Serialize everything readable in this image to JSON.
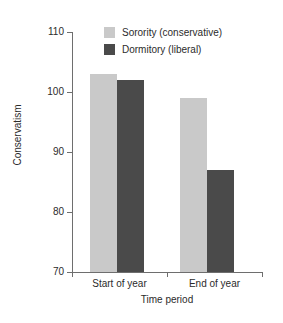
{
  "chart_data": {
    "type": "bar",
    "title": "",
    "subtitle": "",
    "xlabel": "Time period",
    "ylabel": "Conservatism",
    "categories": [
      "Start of year",
      "End of year"
    ],
    "series": [
      {
        "name": "Sorority (conservative)",
        "color": "#c9c9c9",
        "values": [
          103,
          99
        ]
      },
      {
        "name": "Dormitory (liberal)",
        "color": "#4a4a4a",
        "values": [
          102,
          87
        ]
      }
    ],
    "ylim": [
      70,
      110
    ],
    "ytick_labels": [
      "110",
      "100",
      "90",
      "80",
      "70"
    ],
    "ytick_values": [
      110,
      100,
      90,
      80,
      70
    ],
    "grid": false,
    "legend_position": "top-center",
    "background_color": "#ffffff",
    "axis_color": "#6e6e6e",
    "text_color": "#2b2b2b"
  }
}
